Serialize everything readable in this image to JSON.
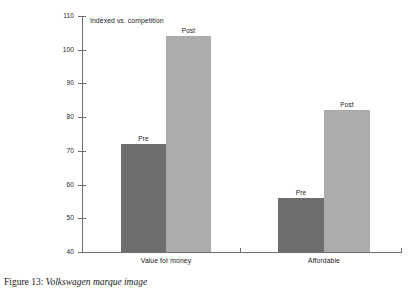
{
  "figure": {
    "caption_number": "Figure 13:",
    "caption_title": "Volkswagen marque image"
  },
  "chart_data": {
    "type": "bar",
    "title": "",
    "subtitle": "",
    "axis_note": "Indexed vs. competition",
    "xlabel": "",
    "ylabel": "",
    "categories": [
      "Value for money",
      "Affordable"
    ],
    "series": [
      {
        "name": "Pre",
        "values": [
          72,
          56
        ],
        "color": "#6e6e6e"
      },
      {
        "name": "Post",
        "values": [
          104,
          82
        ],
        "color": "#acacac"
      }
    ],
    "point_labels": [
      {
        "text": "Pre",
        "category": "Value for money",
        "series": "Pre"
      },
      {
        "text": "Post",
        "category": "Value for money",
        "series": "Post"
      },
      {
        "text": "Pre",
        "category": "Affordable",
        "series": "Pre"
      },
      {
        "text": "Post",
        "category": "Affordable",
        "series": "Post"
      }
    ],
    "ylim": [
      40,
      110
    ],
    "yticks": [
      40,
      50,
      60,
      70,
      80,
      90,
      100,
      110
    ],
    "ytick_labels": [
      "40",
      "50",
      "60",
      "70",
      "80",
      "90",
      "100",
      "110"
    ],
    "grid": false,
    "legend": "none",
    "axis_color": "#6d6d6d",
    "background": "#ffffff"
  }
}
